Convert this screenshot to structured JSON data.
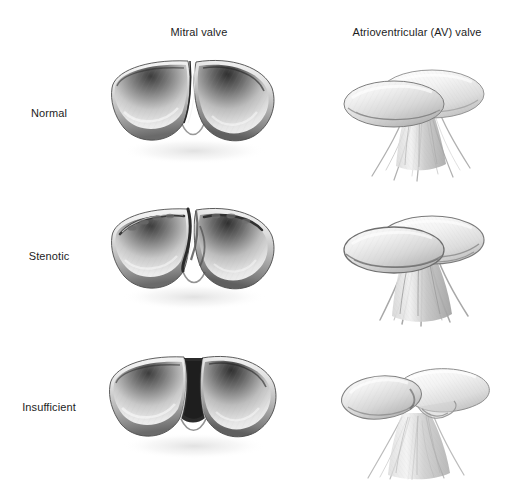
{
  "figure": {
    "background_color": "#ffffff",
    "ink_color": "#1d1d1d",
    "medium": "grayscale pencil illustration",
    "columns": [
      {
        "id": "mitral",
        "label": "Mitral valve"
      },
      {
        "id": "av",
        "label": "Atrioventricular (AV) valve"
      }
    ],
    "rows": [
      {
        "id": "normal",
        "label": "Normal"
      },
      {
        "id": "stenotic",
        "label": "Stenotic"
      },
      {
        "id": "insufficient",
        "label": "Insufficient"
      }
    ]
  },
  "illustrations": {
    "normal_mitral": {
      "name": "normal-mitral-valve-illustration",
      "view": "superior view of closed mitral valve",
      "description": "Two smooth bowl-shaped leaflet cusps meeting along a thin clean coaptation line",
      "tone_light": "#f2f2f2",
      "tone_mid": "#b4b4b4",
      "tone_dark": "#4a4a4a"
    },
    "normal_av": {
      "name": "normal-av-valve-illustration",
      "view": "oblique view of AV valve with chordae tendineae",
      "description": "Two overlapping elliptical leaflets supported by slender chordae tendineae converging to papillary muscles",
      "tone_light": "#f4f4f4",
      "tone_mid": "#c4c4c4",
      "tone_dark": "#7a7a7a"
    },
    "stenotic_mitral": {
      "name": "stenotic-mitral-valve-illustration",
      "view": "superior view of stenotic mitral valve",
      "description": "Leaflets with thickened nodular irregular commissural ridges narrowing the orifice",
      "tone_light": "#ededed",
      "tone_mid": "#a8a8a8",
      "tone_dark": "#3f3f3f"
    },
    "stenotic_av": {
      "name": "stenotic-av-valve-illustration",
      "view": "oblique view of stenotic AV valve",
      "description": "Thickened leaflets with fused shortened chordae tendineae bundled together",
      "tone_light": "#f2f2f2",
      "tone_mid": "#bdbdbd",
      "tone_dark": "#6e6e6e"
    },
    "insufficient_mitral": {
      "name": "insufficient-mitral-valve-illustration",
      "view": "superior view of insufficient mitral valve",
      "description": "Leaflets failing to coapt leaving a dark triangular regurgitant gap between cusps",
      "tone_light": "#f0f0f0",
      "tone_mid": "#ababab",
      "tone_dark": "#363636"
    },
    "insufficient_av": {
      "name": "insufficient-av-valve-illustration",
      "view": "oblique view of insufficient AV valve",
      "description": "Prolapsed funnel-shaped leaflet with elongated stretched chordae tendineae",
      "tone_light": "#f6f6f6",
      "tone_mid": "#cccccc",
      "tone_dark": "#868686"
    }
  }
}
